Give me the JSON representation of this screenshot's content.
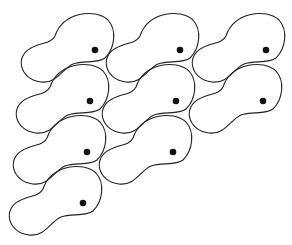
{
  "diagram": {
    "stroke_color": "#222222",
    "dot_color": "#111111",
    "background": "#ffffff",
    "tiles": [
      {
        "row": 1,
        "col": 1,
        "dot": [
          95,
          50
        ]
      },
      {
        "row": 1,
        "col": 2,
        "dot": [
          180,
          50
        ]
      },
      {
        "row": 1,
        "col": 3,
        "dot": [
          266,
          50
        ]
      },
      {
        "row": 2,
        "col": 1,
        "dot": [
          90,
          101
        ]
      },
      {
        "row": 2,
        "col": 2,
        "dot": [
          176,
          101
        ]
      },
      {
        "row": 2,
        "col": 3,
        "dot": [
          263,
          101
        ]
      },
      {
        "row": 3,
        "col": 1,
        "dot": [
          87,
          152
        ]
      },
      {
        "row": 3,
        "col": 2,
        "dot": [
          173,
          152
        ]
      },
      {
        "row": 4,
        "col": 1,
        "dot": [
          83,
          203
        ]
      }
    ]
  }
}
